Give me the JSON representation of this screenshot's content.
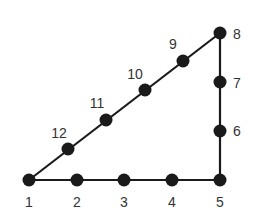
{
  "diagram": {
    "type": "right-triangle-node-graph",
    "nodes": [
      {
        "id": "1",
        "label": "1",
        "x": 29,
        "y": 180,
        "lx": 29,
        "ly": 207,
        "anchor": "middle"
      },
      {
        "id": "2",
        "label": "2",
        "x": 77,
        "y": 180,
        "lx": 77,
        "ly": 207,
        "anchor": "middle"
      },
      {
        "id": "3",
        "label": "3",
        "x": 124,
        "y": 180,
        "lx": 124,
        "ly": 207,
        "anchor": "middle"
      },
      {
        "id": "4",
        "label": "4",
        "x": 172,
        "y": 180,
        "lx": 172,
        "ly": 207,
        "anchor": "middle"
      },
      {
        "id": "5",
        "label": "5",
        "x": 220,
        "y": 180,
        "lx": 220,
        "ly": 207,
        "anchor": "middle"
      },
      {
        "id": "6",
        "label": "6",
        "x": 220,
        "y": 131,
        "lx": 233,
        "ly": 136,
        "anchor": "start"
      },
      {
        "id": "7",
        "label": "7",
        "x": 220,
        "y": 82,
        "lx": 233,
        "ly": 88,
        "anchor": "start"
      },
      {
        "id": "8",
        "label": "8",
        "x": 220,
        "y": 33,
        "lx": 233,
        "ly": 39,
        "anchor": "start"
      },
      {
        "id": "9",
        "label": "9",
        "x": 183,
        "y": 61,
        "lx": 173,
        "ly": 49,
        "anchor": "middle"
      },
      {
        "id": "10",
        "label": "10",
        "x": 145,
        "y": 90,
        "lx": 135,
        "ly": 79,
        "anchor": "middle"
      },
      {
        "id": "11",
        "label": "11",
        "x": 106,
        "y": 120,
        "lx": 97,
        "ly": 108,
        "anchor": "middle"
      },
      {
        "id": "12",
        "label": "12",
        "x": 68,
        "y": 149,
        "lx": 59,
        "ly": 138,
        "anchor": "middle"
      }
    ],
    "edges": [
      {
        "from": "1",
        "to": "5"
      },
      {
        "from": "5",
        "to": "8"
      },
      {
        "from": "8",
        "to": "1"
      }
    ],
    "colors": {
      "node": "#1a1a1a",
      "edge": "#1a1a1a",
      "label": "#333333"
    }
  }
}
